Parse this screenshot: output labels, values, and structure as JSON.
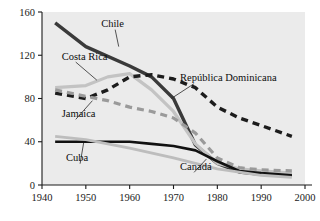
{
  "chart_data": {
    "type": "line",
    "title": "",
    "xlabel": "",
    "ylabel": "",
    "xlim": [
      1940,
      2000
    ],
    "ylim": [
      0,
      160
    ],
    "xticks": [
      "1940",
      "1950",
      "1960",
      "1970",
      "1980",
      "1990",
      "2000"
    ],
    "yticks": [
      "0",
      "40",
      "80",
      "120",
      "160"
    ],
    "grid": false,
    "legend_position": "inline-labels",
    "plot_background": "#ebebeb",
    "series": [
      {
        "name": "Chile",
        "style": "solid",
        "color": "#3a3a3a",
        "width": 3.4,
        "label_anchor": {
          "x": 1953.5,
          "y": 146
        },
        "x": [
          1943,
          1950,
          1960,
          1965,
          1970,
          1975,
          1980,
          1985,
          1990,
          1997
        ],
        "values": [
          150,
          128,
          110,
          100,
          80,
          37,
          20,
          12,
          10,
          9
        ]
      },
      {
        "name": "Costa Rica",
        "style": "solid",
        "color": "#c3c3c3",
        "width": 3.2,
        "label_anchor": {
          "x": 1944.5,
          "y": 116
        },
        "x": [
          1943,
          1950,
          1955,
          1960,
          1965,
          1970,
          1975,
          1980,
          1985,
          1990,
          1997
        ],
        "values": [
          90,
          92,
          100,
          103,
          88,
          68,
          38,
          20,
          15,
          13,
          11
        ]
      },
      {
        "name": "República Dominicana",
        "style": "dashed",
        "color": "#1c1c1c",
        "width": 3.4,
        "label_anchor": {
          "x": 1971.5,
          "y": 96
        },
        "x": [
          1943,
          1950,
          1955,
          1960,
          1965,
          1970,
          1975,
          1980,
          1985,
          1990,
          1997
        ],
        "values": [
          85,
          80,
          88,
          100,
          102,
          98,
          90,
          72,
          62,
          55,
          45
        ]
      },
      {
        "name": "Jamaica",
        "style": "dashed",
        "color": "#9a9a9a",
        "width": 3.2,
        "label_anchor": {
          "x": 1944.5,
          "y": 63
        },
        "x": [
          1943,
          1950,
          1955,
          1960,
          1965,
          1970,
          1975,
          1980,
          1985,
          1990,
          1997
        ],
        "values": [
          88,
          82,
          78,
          72,
          68,
          62,
          48,
          25,
          16,
          14,
          13
        ]
      },
      {
        "name": "Cuba",
        "style": "solid",
        "color": "#111111",
        "width": 2.6,
        "label_anchor": {
          "x": 1945.5,
          "y": 22
        },
        "x": [
          1943,
          1950,
          1960,
          1965,
          1970,
          1975,
          1980,
          1985,
          1990,
          1997
        ],
        "values": [
          40,
          40,
          40,
          38,
          36,
          32,
          22,
          13,
          11,
          9
        ]
      },
      {
        "name": "Canadá",
        "style": "solid",
        "color": "#bdbdbd",
        "width": 2.8,
        "label_anchor": {
          "x": 1971.5,
          "y": 14
        },
        "x": [
          1943,
          1950,
          1960,
          1970,
          1980,
          1990,
          1997
        ],
        "values": [
          45,
          42,
          34,
          25,
          15,
          9,
          7
        ]
      }
    ]
  }
}
